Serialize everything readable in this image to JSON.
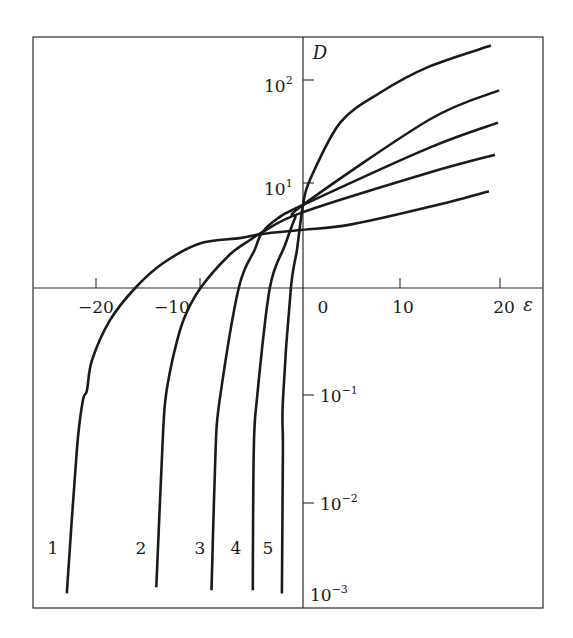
{
  "chart_data": {
    "type": "line",
    "title": "",
    "xlabel": "ε",
    "ylabel": "D",
    "xscale": "linear",
    "yscale": "log",
    "xlim": [
      -26.5,
      24
    ],
    "ylim": [
      0.001,
      400
    ],
    "x_axis_crosses_at_y": 1,
    "y_axis_crosses_at_x": 0,
    "grid": false,
    "legend": "none (curves labelled 1-5 directly near bottom)",
    "x_ticks": [
      {
        "value": -20,
        "label": "−20"
      },
      {
        "value": -10,
        "label": "−10"
      },
      {
        "value": 0,
        "label": "0"
      },
      {
        "value": 10,
        "label": "10"
      },
      {
        "value": 20,
        "label": "20"
      }
    ],
    "y_ticks": [
      {
        "value": 100,
        "base": "10",
        "exp": "2"
      },
      {
        "value": 10,
        "base": "10",
        "exp": "1"
      },
      {
        "value": 0.1,
        "base": "10",
        "exp": "−1"
      },
      {
        "value": 0.01,
        "base": "10",
        "exp": "−2"
      },
      {
        "value": 0.001,
        "base": "10",
        "exp": "−3"
      }
    ],
    "series": [
      {
        "name": "1",
        "label": "1",
        "x": [
          -23.5,
          -22.5,
          -21.9,
          -21.5,
          -21.0,
          -19.2,
          -16.7,
          -13.9,
          -10.2,
          -6.3,
          -4.0,
          0,
          4.7,
          12.6,
          18.5
        ],
        "y": [
          0.0014,
          0.031,
          0.089,
          0.11,
          0.21,
          0.5,
          1.0,
          1.74,
          2.69,
          3.02,
          3.31,
          3.63,
          4.07,
          6.03,
          8.5
        ]
      },
      {
        "name": "2",
        "label": "2",
        "x": [
          -14.6,
          -14.0,
          -13.7,
          -13.0,
          -11.9,
          -10.2,
          -7.3,
          -5.3,
          -4.0,
          0,
          12.6,
          19.1
        ],
        "y": [
          0.0016,
          0.031,
          0.089,
          0.21,
          0.5,
          1.0,
          2.09,
          2.88,
          3.47,
          5.37,
          12.9,
          19.1
        ]
      },
      {
        "name": "3",
        "label": "3",
        "x": [
          -9.1,
          -8.7,
          -8.3,
          -6.4,
          -4.8,
          -4.1,
          -2.5,
          0,
          12.6,
          19.4
        ],
        "y": [
          0.0015,
          0.031,
          0.089,
          1.0,
          2.34,
          3.39,
          4.68,
          6.3,
          22.4,
          38.9
        ]
      },
      {
        "name": "4",
        "label": "4",
        "x": [
          -5.0,
          -4.9,
          -4.6,
          -3.3,
          -1.8,
          -0.8,
          0,
          12.6,
          19.5
        ],
        "y": [
          0.0015,
          0.031,
          0.089,
          1.0,
          2.57,
          4.68,
          6.3,
          41.7,
          79.4
        ]
      },
      {
        "name": "5",
        "label": "5",
        "x": [
          -2.1,
          -2.0,
          -2.0,
          -1.2,
          -0.6,
          0,
          0.7,
          3.7,
          7.7,
          12.6,
          18.7
        ],
        "y": [
          0.0014,
          0.031,
          0.089,
          1.0,
          2.34,
          6.3,
          11.0,
          38.9,
          75.9,
          135,
          214
        ]
      }
    ],
    "annotations": [
      {
        "text": "1",
        "near_series": "1",
        "position": "left of curve bottom"
      },
      {
        "text": "2",
        "near_series": "2",
        "position": "left of curve bottom"
      },
      {
        "text": "3",
        "near_series": "3",
        "position": "left of curve bottom"
      },
      {
        "text": "4",
        "near_series": "4",
        "position": "left of curve bottom"
      },
      {
        "text": "5",
        "near_series": "5",
        "position": "left of curve bottom"
      }
    ]
  },
  "labels": {
    "x_axis": "ε",
    "y_axis": "D",
    "x_ticks": [
      "−20",
      "−10",
      "0",
      "10",
      "20"
    ],
    "y_tick_base": "10",
    "y_tick_exps": [
      "2",
      "1",
      "−1",
      "−2",
      "−3"
    ],
    "curve_labels": [
      "1",
      "2",
      "3",
      "4",
      "5"
    ]
  }
}
